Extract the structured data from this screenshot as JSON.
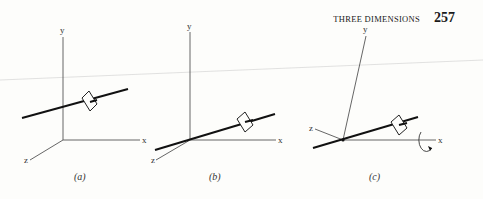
{
  "header": {
    "running_head": "THREE DIMENSIONS",
    "page_number": "257"
  },
  "figures": [
    {
      "id": "a",
      "caption": "(a)",
      "axes": {
        "x": "x",
        "y": "y",
        "z": "z"
      }
    },
    {
      "id": "b",
      "caption": "(b)",
      "axes": {
        "x": "x",
        "y": "y",
        "z": "z"
      }
    },
    {
      "id": "c",
      "caption": "(c)",
      "axes": {
        "x": "x",
        "y": "y",
        "z": "z"
      },
      "rotation_icon": "rotation-arrow-about-x"
    }
  ],
  "colors": {
    "ink": "#1a1a1a",
    "axis": "#555555",
    "paper": "#fdfdfb"
  }
}
